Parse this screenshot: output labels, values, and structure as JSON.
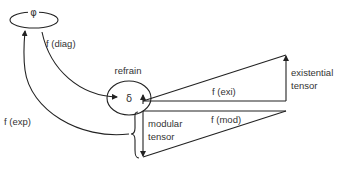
{
  "diagram": {
    "nodes": {
      "phi": {
        "symbol": "φ"
      },
      "refrain": {
        "label": "refrain",
        "symbol": "δ"
      }
    },
    "edges": {
      "diag": {
        "label": "f (diag)"
      },
      "exp": {
        "label": "f (exp)"
      },
      "exi": {
        "label": "f (exi)"
      },
      "mod": {
        "label": "f (mod)"
      }
    },
    "tensors": {
      "existential": {
        "line1": "existential",
        "line2": "tensor"
      },
      "modular": {
        "line1": "modular",
        "line2": "tensor"
      }
    },
    "colors": {
      "stroke": "#222222",
      "text": "#333333",
      "background": "#ffffff"
    }
  }
}
